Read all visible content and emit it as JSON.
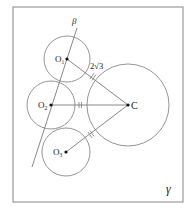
{
  "figure": {
    "type": "geometry-diagram",
    "plane_label": "γ",
    "line_label": "β",
    "colors": {
      "stroke": "#8a8a8a",
      "frame": "#9a9a9a",
      "text": "#222222",
      "point": "#111111"
    }
  },
  "points": {
    "O1": {
      "label": "O",
      "sub": "1"
    },
    "O2": {
      "label": "O",
      "sub": "2"
    },
    "O3": {
      "label": "O",
      "sub": "3"
    },
    "C": {
      "label": "C"
    }
  },
  "annotations": {
    "segment_O1C_length": "2√3",
    "equal_tick_mark": "="
  },
  "circles": [
    {
      "name": "circle-O1",
      "center": "O1"
    },
    {
      "name": "circle-O2",
      "center": "O2"
    },
    {
      "name": "circle-O3",
      "center": "O3"
    },
    {
      "name": "circle-C",
      "center": "C"
    }
  ]
}
